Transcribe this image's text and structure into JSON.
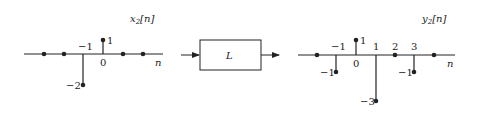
{
  "input_plot": {
    "title": "x",
    "title_sub": "2",
    "title_arg": "[n]",
    "axis_label": "n",
    "samples": [
      {
        "n": -3,
        "value": 0
      },
      {
        "n": -2,
        "value": 0
      },
      {
        "n": -1,
        "value": -2
      },
      {
        "n": 0,
        "value": 1
      },
      {
        "n": 1,
        "value": 0
      },
      {
        "n": 2,
        "value": 0
      }
    ],
    "tick_labels": {
      "n_minus1": "−1",
      "n_0": "0"
    },
    "value_labels": {
      "v_minus2": "−2",
      "v_1": "1"
    }
  },
  "system": {
    "label": "L"
  },
  "output_plot": {
    "title": "y",
    "title_sub": "2",
    "title_arg": "[n]",
    "axis_label": "n",
    "samples": [
      {
        "n": -2,
        "value": 0
      },
      {
        "n": -1,
        "value": -1
      },
      {
        "n": 0,
        "value": 1
      },
      {
        "n": 1,
        "value": -3
      },
      {
        "n": 2,
        "value": 0
      },
      {
        "n": 3,
        "value": -1
      },
      {
        "n": 4,
        "value": 0
      }
    ],
    "tick_labels": {
      "n_minus1": "−1",
      "n_0": "0",
      "n_1": "1",
      "n_2": "2",
      "n_3": "3"
    },
    "value_labels": {
      "v_minus1_at_minus1": "−1",
      "v_1": "1",
      "v_minus3": "−3",
      "v_minus1_at_3": "−1"
    }
  },
  "colors": {
    "ink": "#222222"
  }
}
